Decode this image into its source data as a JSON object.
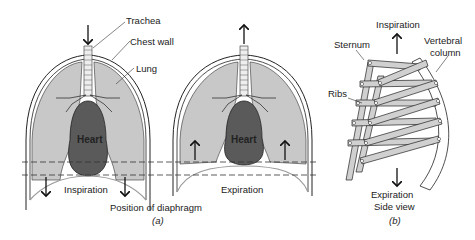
{
  "figure": {
    "panel_a": {
      "caption": "(a)",
      "labels": {
        "trachea": "Trachea",
        "chest_wall": "Chest wall",
        "lung": "Lung",
        "heart": "Heart",
        "diaphragm_position": "Position of diaphragm"
      },
      "left_state": "Inspiration",
      "right_state": "Expiration",
      "left_airflow": "in",
      "right_airflow": "out"
    },
    "panel_b": {
      "caption": "(b)",
      "labels": {
        "inspiration": "Inspiration",
        "sternum": "Sternum",
        "vertebral_column": "Vertebral column",
        "vertebral_line1": "Vertebral",
        "vertebral_line2": "column",
        "ribs": "Ribs",
        "expiration": "Expiration",
        "side_view": "Side view"
      }
    },
    "colors": {
      "lung": "#c8c8c8",
      "heart": "#5a5a5a",
      "ribs": "#d0d0d0",
      "outline": "#222222"
    }
  }
}
